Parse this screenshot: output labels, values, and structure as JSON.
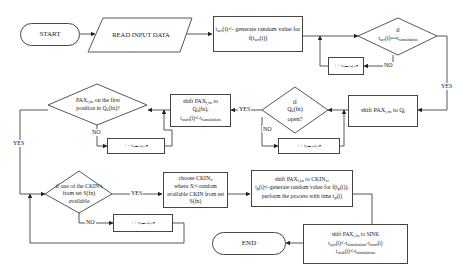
{
  "diagram": {
    "type": "flowchart",
    "nodes": {
      "start": "START",
      "read_input": "READ INPUT DATA",
      "gen_arrival": "tₐᵣᵣ(i)<- generate random value for f(tₐᵣᵣ(i))",
      "if_arrival": "if tₐᵣᵣ(i)==tₛᵢₘᵤₗₐₜᵢₒₙ",
      "inc_sim_1": "++ tₛᵢₘᵤₗₐₜᵢₒₙ",
      "shift_qt": "shift PAXᵢ,fₙ to Qₜ",
      "if_qs_open": "if Qₛ(fn) open?",
      "inc_sim_2": "++ tₛᵢₘᵤₗₐₜᵢₒₙ",
      "shift_qs": "shift PAXᵢ,fₙ to Qₛ(fn), tₛₜₐᵣₜ(i)<-tₛᵢₘᵤₗₐₜᵢₒₙ",
      "if_first_pos": "PAXᵢ,fₙ on the first position in Qₛ(fn)?",
      "inc_sim_3": "++ tₛᵢₘᵤₗₐₜᵢₒₙ",
      "if_ckin_avail": "if one of the CKIN's from set S(fn) available",
      "inc_sim_4": "++ tₛᵢₘᵤₗₐₜᵢₒₙ",
      "choose_ckin": "choose CKINₓ where X<-random available CKIN from set S(fn)",
      "shift_ckin": "shift PAXᵢ,fₙ to CKINₓ, tₚ(i)<-generate random value for f(tₚ(i)), perform the process with time tₚ(i)",
      "shift_sink": "shift PAXᵢ,fₙ to SINK tₛᵧₛ(i)<-tₛᵢₘᵤₗₐₜᵢₒₙ-tₛₜₐᵣₜ(i) tₛᵢₙₖ(i)<-tₛᵢₘᵤₗₐₜᵢₒₙ",
      "end": "END"
    },
    "edge_labels": {
      "yes": "YES",
      "no": "NO"
    }
  }
}
